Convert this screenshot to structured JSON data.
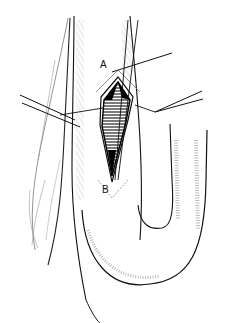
{
  "figure": {
    "type": "surgical-illustration",
    "labels": {
      "a": "A",
      "b": "B"
    },
    "colors": {
      "ink": "#111111",
      "hatch": "#9a9a9a",
      "background": "#ffffff"
    }
  }
}
